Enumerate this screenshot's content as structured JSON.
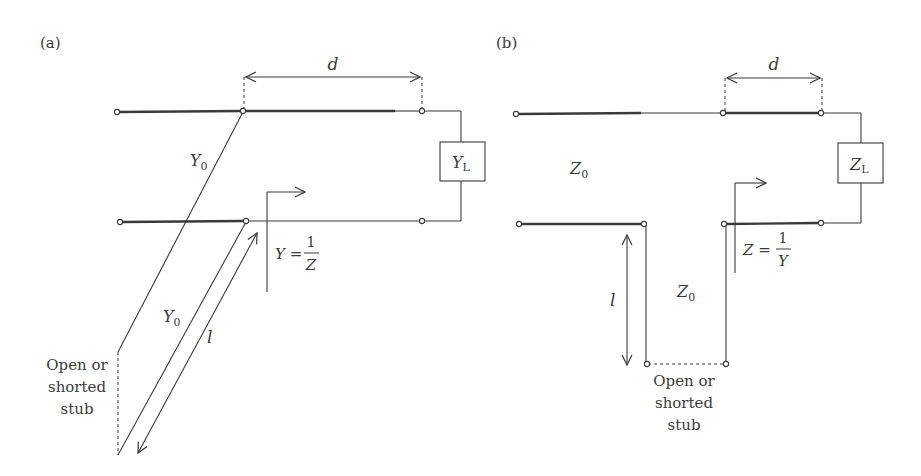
{
  "figure": {
    "panel_a": {
      "label": "(a)",
      "distance_label": "d",
      "line_admittance_upper": "Y",
      "line_admittance_upper_sub": "0",
      "line_admittance_stub": "Y",
      "line_admittance_stub_sub": "0",
      "stub_length_label": "l",
      "load_label": "Y",
      "load_sub": "L",
      "ref_eq_lhs": "Y =",
      "ref_eq_num": "1",
      "ref_eq_den": "Z",
      "stub_caption": [
        "Open or",
        "shorted",
        "stub"
      ]
    },
    "panel_b": {
      "label": "(b)",
      "distance_label": "d",
      "line_impedance_main": "Z",
      "line_impedance_main_sub": "0",
      "line_impedance_stub": "Z",
      "line_impedance_stub_sub": "0",
      "stub_length_label": "l",
      "load_label": "Z",
      "load_sub": "L",
      "ref_eq_lhs": "Z =",
      "ref_eq_num": "1",
      "ref_eq_den": "Y",
      "stub_caption": [
        "Open or",
        "shorted",
        "stub"
      ]
    },
    "colors": {
      "ink": "#3a3a3a",
      "background": "#ffffff"
    }
  }
}
